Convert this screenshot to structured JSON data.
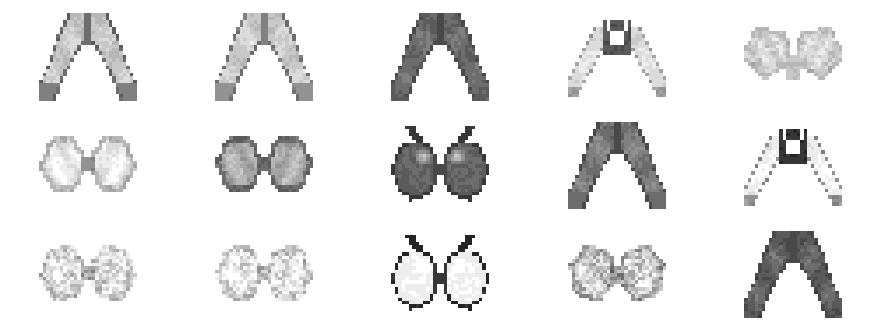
{
  "figure": {
    "kind": "image-grid",
    "rows": 3,
    "cols": 5,
    "background_color": "#ffffff",
    "cell_width": 176,
    "cell_height": 109,
    "sample_pixel_size": 28,
    "pixel_scale": 3.5,
    "rendering": "pixelated",
    "palette": {
      "white": "#ffffff",
      "near_white": "#f2f2f2",
      "light": "#d9d9d9",
      "mid_light": "#bfbfbf",
      "mid": "#a6a6a6",
      "mid_dark": "#8c8c8c",
      "dark": "#6b6b6b",
      "darker": "#4d4d4d",
      "black": "#262626"
    }
  },
  "cells": [
    {
      "id": "r1c1",
      "row": 1,
      "col": 1,
      "label": "sample-r1c1",
      "description": "pale open-winged moth, light grey wings with dark lower rim",
      "tone": "light",
      "shape": "wings-open-down",
      "base_level": 0.78,
      "outline_level": 0.38,
      "body_level": 0.42,
      "seed": 1101
    },
    {
      "id": "r1c2",
      "row": 1,
      "col": 2,
      "label": "sample-r1c2",
      "description": "pale moth, wings angled downward, light grey",
      "tone": "light",
      "shape": "wings-open-down",
      "base_level": 0.8,
      "outline_level": 0.45,
      "body_level": 0.5,
      "seed": 1102
    },
    {
      "id": "r1c3",
      "row": 1,
      "col": 3,
      "label": "sample-r1c3",
      "description": "dark grey moth, broad wings in inverted V",
      "tone": "dark",
      "shape": "wings-open-down",
      "base_level": 0.42,
      "outline_level": 0.3,
      "body_level": 0.3,
      "seed": 1103
    },
    {
      "id": "r1c4",
      "row": 1,
      "col": 4,
      "label": "sample-r1c4",
      "description": "pale wings with dark central body block and white window",
      "tone": "mixed",
      "shape": "wings-dark-body",
      "base_level": 0.86,
      "outline_level": 0.62,
      "body_level": 0.34,
      "seed": 1104
    },
    {
      "id": "r1c5",
      "row": 1,
      "col": 5,
      "label": "sample-r1c5",
      "description": "faint blurry pair of rounded lobes, very low contrast",
      "tone": "very-light",
      "shape": "lobes-blurry",
      "base_level": 0.84,
      "outline_level": 0.72,
      "body_level": 0.78,
      "seed": 1105
    },
    {
      "id": "r2c1",
      "row": 2,
      "col": 1,
      "label": "sample-r2c1",
      "description": "very pale bowtie-shaped pair of rounded wings, near white",
      "tone": "very-light",
      "shape": "bowtie",
      "base_level": 0.94,
      "outline_level": 0.7,
      "body_level": 0.62,
      "seed": 1201
    },
    {
      "id": "r2c2",
      "row": 2,
      "col": 2,
      "label": "sample-r2c2",
      "description": "mid grey bowtie wings with lighter highlights",
      "tone": "mid",
      "shape": "bowtie",
      "base_level": 0.7,
      "outline_level": 0.42,
      "body_level": 0.45,
      "seed": 1202
    },
    {
      "id": "r2c3",
      "row": 2,
      "col": 3,
      "label": "sample-r2c3",
      "description": "two dark grey apples with stems, specular highlight at upper left",
      "tone": "dark",
      "shape": "apples",
      "base_level": 0.4,
      "outline_level": 0.22,
      "body_level": 0.22,
      "seed": 1203
    },
    {
      "id": "r2c4",
      "row": 2,
      "col": 4,
      "label": "sample-r2c4",
      "description": "dark grey moth wings angled down, inverted V",
      "tone": "dark",
      "shape": "wings-open-down",
      "base_level": 0.48,
      "outline_level": 0.3,
      "body_level": 0.3,
      "seed": 1204
    },
    {
      "id": "r2c5",
      "row": 2,
      "col": 5,
      "label": "sample-r2c5",
      "description": "white wings with very dark body block and white window",
      "tone": "mixed",
      "shape": "wings-dark-body",
      "base_level": 0.95,
      "outline_level": 0.55,
      "body_level": 0.2,
      "seed": 1205
    },
    {
      "id": "r3c1",
      "row": 3,
      "col": 1,
      "label": "sample-r3c1",
      "description": "faint speckled bowtie, very light grey noise",
      "tone": "very-light",
      "shape": "bowtie-noisy",
      "base_level": 0.9,
      "outline_level": 0.76,
      "body_level": 0.74,
      "seed": 1301
    },
    {
      "id": "r3c2",
      "row": 3,
      "col": 2,
      "label": "sample-r3c2",
      "description": "faint speckled bowtie, slightly lighter than neighbour",
      "tone": "very-light",
      "shape": "bowtie-noisy",
      "base_level": 0.93,
      "outline_level": 0.8,
      "body_level": 0.78,
      "seed": 1302
    },
    {
      "id": "r3c3",
      "row": 3,
      "col": 3,
      "label": "sample-r3c3",
      "description": "two white apples with black outlines and stems",
      "tone": "light-outlined",
      "shape": "apples",
      "base_level": 0.96,
      "outline_level": 0.16,
      "body_level": 0.2,
      "seed": 1303
    },
    {
      "id": "r3c4",
      "row": 3,
      "col": 4,
      "label": "sample-r3c4",
      "description": "grainy mid-light bowtie with heavy speckle",
      "tone": "light",
      "shape": "bowtie-noisy",
      "base_level": 0.82,
      "outline_level": 0.64,
      "body_level": 0.62,
      "seed": 1304
    },
    {
      "id": "r3c5",
      "row": 3,
      "col": 5,
      "label": "sample-r3c5",
      "description": "dark grey moth wings angled downward, solid tone",
      "tone": "dark",
      "shape": "wings-open-down",
      "base_level": 0.38,
      "outline_level": 0.28,
      "body_level": 0.28,
      "seed": 1305
    }
  ],
  "chart_data": {
    "type": "heatmap",
    "xlabel": "",
    "ylabel": "",
    "grid": false,
    "legend": "none",
    "categories": [
      "col 1",
      "col 2",
      "col 3",
      "col 4",
      "col 5"
    ],
    "row_labels": [
      "row 1",
      "row 2",
      "row 3"
    ],
    "series": [
      {
        "name": "row 1 mean brightness",
        "values": [
          0.78,
          0.8,
          0.42,
          0.86,
          0.84
        ]
      },
      {
        "name": "row 2 mean brightness",
        "values": [
          0.94,
          0.7,
          0.4,
          0.48,
          0.95
        ]
      },
      {
        "name": "row 3 mean brightness",
        "values": [
          0.9,
          0.93,
          0.96,
          0.82,
          0.38
        ]
      }
    ],
    "ylim": [
      0,
      1
    ]
  }
}
